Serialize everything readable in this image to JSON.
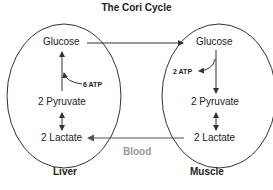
{
  "title": "The Cori Cycle",
  "liver": {
    "label": "Liver",
    "glucose": "Glucose",
    "atp": "6 ATP",
    "pyruvate": "2 Pyruvate",
    "lactate": "2 Lactate"
  },
  "muscle": {
    "label": "Muscle",
    "glucose": "Glucose",
    "atp": "2 ATP",
    "pyruvate": "2 Pyruvate",
    "lactate": "2 Lactate"
  },
  "blood_label": "Blood",
  "colors": {
    "line": "#333333",
    "blood_arrow": "#666666",
    "blood_text": "#999999"
  }
}
